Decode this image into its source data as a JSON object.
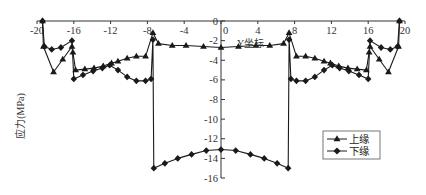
{
  "chart_data": {
    "type": "line",
    "title": "",
    "xlabel": "Y坐标",
    "ylabel": "应力(MPa)",
    "xlim": [
      -20,
      20
    ],
    "ylim": [
      -16,
      0
    ],
    "x_ticks": [
      -20,
      -16,
      -12,
      -8,
      -4,
      0,
      4,
      8,
      12,
      16,
      20
    ],
    "x_tick_labels": [
      "-20",
      "-16",
      "-12",
      "-8",
      "-4",
      "0",
      "4",
      "8",
      "12",
      "16",
      "20"
    ],
    "y_ticks": [
      0,
      -2,
      -4,
      -6,
      -8,
      -10,
      -12,
      -14,
      -16
    ],
    "y_tick_labels": [
      "0",
      "-2",
      "-4",
      "-6",
      "-8",
      "-10",
      "-12",
      "-14",
      "-16"
    ],
    "grid": false,
    "legend_position": "lower right",
    "series": [
      {
        "name": "上缘",
        "marker": "triangle",
        "points": [
          [
            -19.4,
            0.0
          ],
          [
            -19.3,
            -2.6
          ],
          [
            -18.2,
            -5.2
          ],
          [
            -17.2,
            -3.9
          ],
          [
            -16.2,
            -2.6
          ],
          [
            -16.1,
            -3.2
          ],
          [
            -15.8,
            -5.0
          ],
          [
            -14.8,
            -4.9
          ],
          [
            -13.8,
            -4.8
          ],
          [
            -12.8,
            -4.6
          ],
          [
            -11.9,
            -4.3
          ],
          [
            -11.2,
            -4.1
          ],
          [
            -10.2,
            -3.8
          ],
          [
            -9.2,
            -3.6
          ],
          [
            -8.2,
            -3.6
          ],
          [
            -7.4,
            -1.2
          ],
          [
            -6.8,
            -2.3
          ],
          [
            -5.3,
            -2.5
          ],
          [
            -3.8,
            -2.5
          ],
          [
            -1.9,
            -2.6
          ],
          [
            0.0,
            -2.7
          ],
          [
            1.9,
            -2.6
          ],
          [
            3.8,
            -2.5
          ],
          [
            5.3,
            -2.5
          ],
          [
            6.8,
            -2.3
          ],
          [
            7.4,
            -1.2
          ],
          [
            8.2,
            -3.6
          ],
          [
            9.2,
            -3.6
          ],
          [
            10.2,
            -3.8
          ],
          [
            11.2,
            -4.1
          ],
          [
            11.9,
            -4.3
          ],
          [
            12.8,
            -4.6
          ],
          [
            13.8,
            -4.8
          ],
          [
            14.8,
            -4.9
          ],
          [
            15.8,
            -5.0
          ],
          [
            16.1,
            -3.2
          ],
          [
            16.2,
            -2.6
          ],
          [
            17.2,
            -3.9
          ],
          [
            18.2,
            -5.2
          ],
          [
            19.3,
            -2.6
          ],
          [
            19.4,
            0.0
          ]
        ]
      },
      {
        "name": "下缘",
        "marker": "diamond",
        "points": [
          [
            -19.4,
            0.0
          ],
          [
            -19.2,
            -2.6
          ],
          [
            -18.4,
            -2.9
          ],
          [
            -17.4,
            -2.7
          ],
          [
            -16.2,
            -2.0
          ],
          [
            -16.0,
            -5.9
          ],
          [
            -15.0,
            -5.5
          ],
          [
            -13.9,
            -5.1
          ],
          [
            -12.9,
            -4.8
          ],
          [
            -12.1,
            -4.5
          ],
          [
            -11.2,
            -5.0
          ],
          [
            -10.2,
            -5.7
          ],
          [
            -9.2,
            -6.1
          ],
          [
            -8.2,
            -6.1
          ],
          [
            -7.6,
            -5.9
          ],
          [
            -7.4,
            -1.9
          ],
          [
            -7.3,
            -15.0
          ],
          [
            -6.1,
            -14.5
          ],
          [
            -4.7,
            -14.0
          ],
          [
            -3.2,
            -13.6
          ],
          [
            -1.6,
            -13.2
          ],
          [
            0.0,
            -13.1
          ],
          [
            1.6,
            -13.2
          ],
          [
            3.2,
            -13.6
          ],
          [
            4.7,
            -14.0
          ],
          [
            6.1,
            -14.5
          ],
          [
            7.3,
            -15.0
          ],
          [
            7.4,
            -1.9
          ],
          [
            7.6,
            -5.9
          ],
          [
            8.2,
            -6.1
          ],
          [
            9.2,
            -6.1
          ],
          [
            10.2,
            -5.7
          ],
          [
            11.2,
            -5.0
          ],
          [
            12.1,
            -4.5
          ],
          [
            12.9,
            -4.8
          ],
          [
            13.9,
            -5.1
          ],
          [
            15.0,
            -5.5
          ],
          [
            16.0,
            -5.9
          ],
          [
            16.2,
            -2.0
          ],
          [
            17.4,
            -2.7
          ],
          [
            18.4,
            -2.9
          ],
          [
            19.2,
            -2.6
          ],
          [
            19.4,
            0.0
          ]
        ]
      }
    ]
  },
  "legend": {
    "items": [
      {
        "label": "上缘",
        "marker": "triangle"
      },
      {
        "label": "下缘",
        "marker": "diamond"
      }
    ]
  },
  "colors": {
    "line": "#1a1a1a",
    "axis": "#333333",
    "background": "#ffffff"
  }
}
